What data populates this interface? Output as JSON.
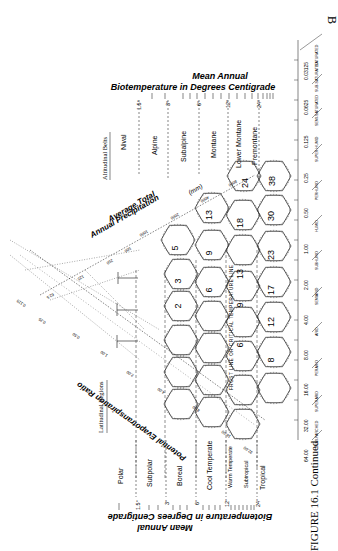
{
  "figure": {
    "corner_label": "B",
    "caption": "FIGURE 16.1 Continued",
    "title_top": {
      "line1": "Mean Annual",
      "line2": "Biotemperature  in Degrees  Centigrade"
    },
    "title_bottom": {
      "line1": "Mean Annual",
      "line2": "Biotemperature  in Degrees  Centigrade"
    },
    "precip_axis": {
      "line1": "Average Total",
      "line2": "Annual Precipitation",
      "unit": "(mm)",
      "ticks": [
        "62.5",
        "125",
        "250",
        "500",
        "1000",
        "2000",
        "4000",
        "8000"
      ]
    },
    "pet_axis": {
      "label": "Potential Evapotranspiration Ratio",
      "ticks": [
        "0.125",
        "0.25",
        "0.50",
        "1.00",
        "2.00",
        "4.00",
        "8.00",
        "16.00",
        "32.00"
      ]
    },
    "humidity_axis": {
      "ticks": [
        "64.00",
        "32.00",
        "16.00",
        "8.00",
        "4.00",
        "2.00",
        "1.00",
        "0.50",
        "0.25",
        "0.125",
        "0.0625",
        "0.03125"
      ],
      "provinces": [
        "SEMI-PARCHED",
        "SUPERARID",
        "PERARID",
        "ARID",
        "SEMIARID",
        "SUBHUMID",
        "HUMID",
        "PERHUMID",
        "SUPER-HUMID",
        "SEMI-SATURATED",
        "SUB-SATURATED",
        "SATURATED"
      ]
    },
    "altitudinal": {
      "heading": "Altitudinal Belts",
      "belts": [
        "Nival",
        "Alpine",
        "Subalpine",
        "Montane",
        "Lower Montane",
        "Premontane"
      ]
    },
    "latitudinal": {
      "heading": "Latitudinal Regions",
      "regions": [
        "Polar",
        "Subpolar",
        "Boreal",
        "Cool Temperate",
        "Warm Temperate",
        "Subtropical",
        "Tropical"
      ]
    },
    "temp_ticks": [
      "1.5°",
      "3°",
      "6°",
      "12°",
      "24°"
    ],
    "frost_line": "FROST  LINE  OR  CRITICAL  TEMPERATURE  LINE",
    "hex_values": [
      [
        "5",
        "13",
        "24",
        "38"
      ],
      [
        "3",
        "9",
        "18",
        "30"
      ],
      [
        "2",
        "6",
        "13",
        "23"
      ],
      [
        "",
        "",
        "9",
        "17"
      ],
      [
        "6",
        "12"
      ],
      [
        "8"
      ]
    ]
  }
}
